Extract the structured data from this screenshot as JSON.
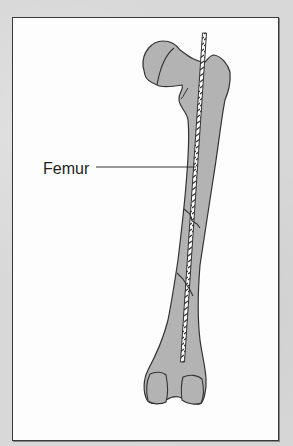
{
  "figure": {
    "type": "anatomical-illustration",
    "labels": [
      {
        "text": "Femur",
        "points_to": "femur shaft"
      }
    ],
    "colors": {
      "background": "#d8d8d8",
      "frame_fill": "#fdfdfd",
      "frame_border": "#3a3a3a",
      "bone_fill": "#b3b3b3",
      "outline": "#333333",
      "rod_fill": "#ffffff"
    },
    "fracture_count": 2
  }
}
